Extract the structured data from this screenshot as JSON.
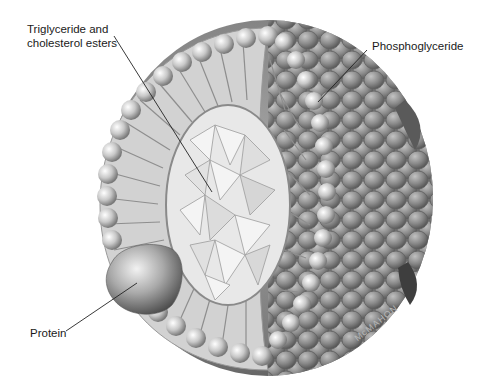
{
  "figure": {
    "labels": {
      "core": [
        "Triglyceride and",
        "cholesterol esters"
      ],
      "shell": "Phosphoglyceride",
      "protein": "Protein"
    },
    "signature": "McMAHON",
    "colors": {
      "background": "#ffffff",
      "text": "#1a1a1a",
      "shell_dark": "#6e6e6e",
      "shell_light": "#d9d9d9",
      "core": "#e6e6e6",
      "leader_line": "#222222",
      "watermark": "#b8b8b8"
    }
  }
}
